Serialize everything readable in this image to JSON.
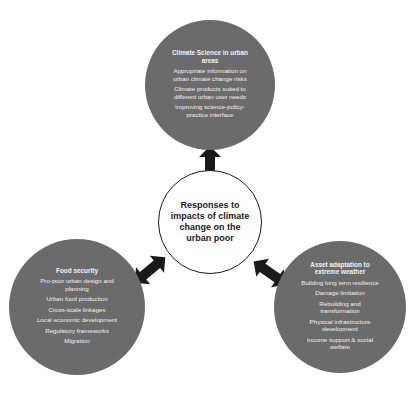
{
  "diagram": {
    "center": {
      "label": "Responses to impacts of climate change on the urban poor"
    },
    "nodes": [
      {
        "id": "top",
        "title": "Climate Science in urban areas",
        "items": [
          "Appropriate information on urban climate change risks",
          "Climate products suited to different urban user needs",
          "Improving science-policy-practice interface"
        ]
      },
      {
        "id": "bottom-left",
        "title": "Food security",
        "items": [
          "Pro-poor urban design and planning",
          "Urban food production",
          "Cross-scale linkages",
          "Local economic development",
          "Regulatory frameworks",
          "Migration"
        ]
      },
      {
        "id": "bottom-right",
        "title": "Asset adaptation to extreme weather",
        "items": [
          "Building long term resilience",
          "Damage limitation",
          "Rebuilding and transformation",
          "Physical infrastructure development",
          "Income support & social welfare"
        ]
      }
    ],
    "connectors": [
      {
        "from": "center",
        "to": "top",
        "type": "double-arrow"
      },
      {
        "from": "center",
        "to": "bottom-left",
        "type": "double-arrow"
      },
      {
        "from": "center",
        "to": "bottom-right",
        "type": "double-arrow"
      }
    ],
    "colors": {
      "node_fill": "#6b6b6b",
      "node_text": "#f2f2f2",
      "center_fill": "#ffffff",
      "center_border": "#1a1a1a",
      "arrow": "#1a1a1a"
    }
  }
}
